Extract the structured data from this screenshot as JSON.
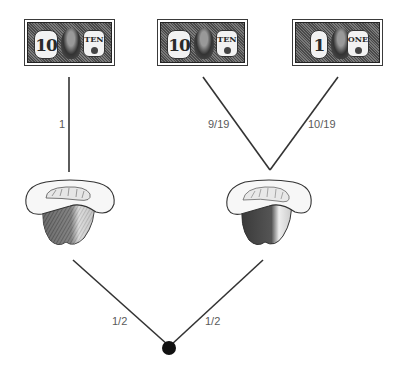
{
  "diagram": {
    "root": {
      "shape": "filled-circle",
      "color": "#111111"
    },
    "hats": [
      {
        "id": "hat-left",
        "label": "hat"
      },
      {
        "id": "hat-right",
        "label": "hat"
      }
    ],
    "bills": [
      {
        "id": "bill-left-ten",
        "denomination_numeral": "10",
        "denomination_word": "TEN"
      },
      {
        "id": "bill-middle-ten",
        "denomination_numeral": "10",
        "denomination_word": "TEN"
      },
      {
        "id": "bill-right-one",
        "denomination_numeral": "1",
        "denomination_word": "ONE"
      }
    ],
    "edges": [
      {
        "from": "root",
        "to": "hat-left",
        "probability": "1/2"
      },
      {
        "from": "root",
        "to": "hat-right",
        "probability": "1/2"
      },
      {
        "from": "hat-left",
        "to": "bill-left-ten",
        "probability": "1"
      },
      {
        "from": "hat-right",
        "to": "bill-middle-ten",
        "probability": "9/19"
      },
      {
        "from": "hat-right",
        "to": "bill-right-one",
        "probability": "10/19"
      }
    ],
    "colors": {
      "line": "#333333",
      "label": "#5a5a5a",
      "background": "#ffffff"
    }
  }
}
